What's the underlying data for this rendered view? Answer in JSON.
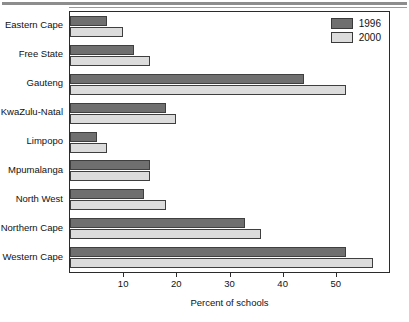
{
  "chart_data": {
    "type": "bar",
    "orientation": "horizontal",
    "title": "",
    "xlabel": "Percent of schools",
    "ylabel": "",
    "xlim": [
      0,
      60
    ],
    "xticks": [
      10,
      20,
      30,
      40,
      50
    ],
    "xticklabels": [
      "10",
      "20",
      "30",
      "40",
      "50"
    ],
    "grid": false,
    "legend_position": "top-right",
    "categories": [
      "Eastern Cape",
      "Free State",
      "Gauteng",
      "KwaZulu-Natal",
      "Limpopo",
      "Mpumalanga",
      "North West",
      "Northern Cape",
      "Western Cape"
    ],
    "series": [
      {
        "name": "1996",
        "color": "#6f6f6f",
        "values": [
          7,
          12,
          44,
          18,
          5,
          15,
          14,
          33,
          52
        ]
      },
      {
        "name": "2000",
        "color": "#dcdcdc",
        "values": [
          10,
          15,
          52,
          20,
          7,
          15,
          18,
          36,
          57
        ]
      }
    ]
  },
  "legend": {
    "items": [
      {
        "label": "1996",
        "color": "#6f6f6f"
      },
      {
        "label": "2000",
        "color": "#dcdcdc"
      }
    ]
  },
  "axis": {
    "x_title": "Percent of schools"
  }
}
